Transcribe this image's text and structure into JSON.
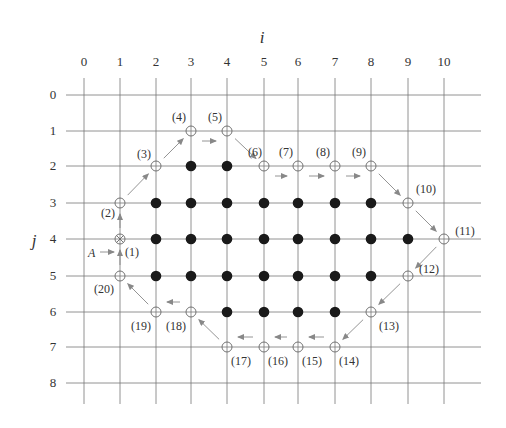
{
  "figure": {
    "x_axis_label": "i",
    "y_axis_label": "j",
    "x_ticks": [
      "0",
      "1",
      "2",
      "3",
      "4",
      "5",
      "6",
      "7",
      "8",
      "9",
      "10"
    ],
    "y_ticks": [
      "0",
      "1",
      "2",
      "3",
      "4",
      "5",
      "6",
      "7",
      "8"
    ],
    "start_marker_label": "A",
    "filled_points": [
      [
        3,
        2
      ],
      [
        4,
        2
      ],
      [
        2,
        3
      ],
      [
        3,
        3
      ],
      [
        4,
        3
      ],
      [
        5,
        3
      ],
      [
        6,
        3
      ],
      [
        7,
        3
      ],
      [
        8,
        3
      ],
      [
        2,
        4
      ],
      [
        3,
        4
      ],
      [
        4,
        4
      ],
      [
        5,
        4
      ],
      [
        6,
        4
      ],
      [
        7,
        4
      ],
      [
        8,
        4
      ],
      [
        9,
        4
      ],
      [
        2,
        5
      ],
      [
        3,
        5
      ],
      [
        4,
        5
      ],
      [
        5,
        5
      ],
      [
        6,
        5
      ],
      [
        7,
        5
      ],
      [
        8,
        5
      ],
      [
        4,
        6
      ],
      [
        5,
        6
      ],
      [
        6,
        6
      ],
      [
        7,
        6
      ]
    ],
    "boundary_points": [
      {
        "n": "(1)",
        "i": 1,
        "j": 4,
        "type": "start-crossed"
      },
      {
        "n": "(2)",
        "i": 1,
        "j": 3
      },
      {
        "n": "(3)",
        "i": 2,
        "j": 2
      },
      {
        "n": "(4)",
        "i": 3,
        "j": 1
      },
      {
        "n": "(5)",
        "i": 4,
        "j": 1
      },
      {
        "n": "(6)",
        "i": 5,
        "j": 2
      },
      {
        "n": "(7)",
        "i": 6,
        "j": 2
      },
      {
        "n": "(8)",
        "i": 7,
        "j": 2
      },
      {
        "n": "(9)",
        "i": 8,
        "j": 2
      },
      {
        "n": "(10)",
        "i": 9,
        "j": 3
      },
      {
        "n": "(11)",
        "i": 10,
        "j": 4
      },
      {
        "n": "(12)",
        "i": 9,
        "j": 5
      },
      {
        "n": "(13)",
        "i": 8,
        "j": 6
      },
      {
        "n": "(14)",
        "i": 7,
        "j": 7
      },
      {
        "n": "(15)",
        "i": 6,
        "j": 7
      },
      {
        "n": "(16)",
        "i": 5,
        "j": 7
      },
      {
        "n": "(17)",
        "i": 4,
        "j": 7
      },
      {
        "n": "(18)",
        "i": 3,
        "j": 6
      },
      {
        "n": "(19)",
        "i": 2,
        "j": 6
      },
      {
        "n": "(20)",
        "i": 1,
        "j": 5
      }
    ]
  }
}
